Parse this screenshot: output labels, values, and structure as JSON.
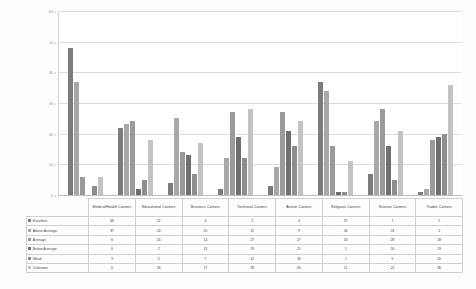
{
  "chart_data": {
    "type": "bar",
    "title": "",
    "subtitle": "",
    "xlabel": "",
    "ylabel": "",
    "ylim": [
      0,
      60
    ],
    "yticks": [
      0,
      10,
      20,
      30,
      40,
      50,
      60
    ],
    "grid": true,
    "legend_position": "table-row-labels",
    "categories": [
      "Medical/Health Careers",
      "Educational Careers",
      "Business Careers",
      "Technical Careers",
      "Artistic Careers",
      "Religious Careers",
      "Science Careers",
      "Trades Careers"
    ],
    "series": [
      {
        "name": "Excellent",
        "color": "#7c7c7c",
        "values": [
          48,
          22,
          4,
          2,
          3,
          37,
          7,
          1
        ]
      },
      {
        "name": "Above Average",
        "color": "#a8a8a8",
        "values": [
          37,
          23,
          25,
          12,
          9,
          34,
          24,
          2
        ]
      },
      {
        "name": "Average",
        "color": "#9a9a9a",
        "values": [
          6,
          24,
          14,
          27,
          27,
          16,
          28,
          18
        ]
      },
      {
        "name": "Below Average",
        "color": "#6f6f6f",
        "values": [
          0,
          2,
          13,
          19,
          21,
          1,
          16,
          19
        ]
      },
      {
        "name": "Weak",
        "color": "#8e8e8e",
        "values": [
          3,
          5,
          7,
          12,
          16,
          1,
          5,
          20
        ]
      },
      {
        "name": "Unknown",
        "color": "#c3c3c3",
        "values": [
          6,
          18,
          17,
          28,
          24,
          11,
          21,
          36
        ]
      }
    ]
  },
  "table": {
    "corner_label": "",
    "column_headers": [
      "Medical/Health Careers",
      "Educational Careers",
      "Business Careers",
      "Technical Careers",
      "Artistic Careers",
      "Religious Careers",
      "Science Careers",
      "Trades Careers"
    ],
    "rows": [
      {
        "label": "Excellent",
        "swatch": "#7c7c7c",
        "values": [
          48,
          22,
          4,
          2,
          3,
          37,
          7,
          1
        ]
      },
      {
        "label": "Above Average",
        "swatch": "#a8a8a8",
        "values": [
          37,
          23,
          25,
          12,
          9,
          34,
          24,
          2
        ]
      },
      {
        "label": "Average",
        "swatch": "#9a9a9a",
        "values": [
          6,
          24,
          14,
          27,
          27,
          16,
          28,
          18
        ]
      },
      {
        "label": "Below Average",
        "swatch": "#6f6f6f",
        "values": [
          0,
          2,
          13,
          19,
          21,
          1,
          16,
          19
        ]
      },
      {
        "label": "Weak",
        "swatch": "#8e8e8e",
        "values": [
          3,
          5,
          7,
          12,
          16,
          1,
          5,
          20
        ]
      },
      {
        "label": "Unknown",
        "swatch": "#c3c3c3",
        "values": [
          6,
          18,
          17,
          28,
          24,
          11,
          21,
          36
        ]
      }
    ]
  }
}
